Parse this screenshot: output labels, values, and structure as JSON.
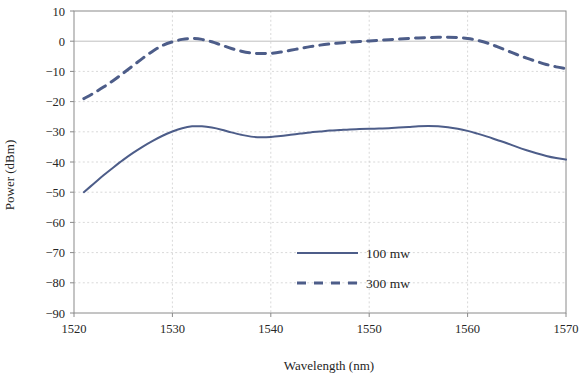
{
  "chart_data": {
    "type": "line",
    "title": "",
    "xlabel": "Wavelength (nm)",
    "ylabel": "Power (dBm)",
    "xlim": [
      1520,
      1570
    ],
    "ylim": [
      -90,
      10
    ],
    "xticks": [
      "1520",
      "1530",
      "1540",
      "1550",
      "1560",
      "1570"
    ],
    "xtick_values": [
      1520,
      1530,
      1540,
      1550,
      1560,
      1570
    ],
    "yticks": [
      "10",
      "0",
      "−10",
      "−20",
      "−30",
      "−40",
      "−50",
      "−60",
      "−70",
      "−80",
      "−90"
    ],
    "ytick_values": [
      10,
      0,
      -10,
      -20,
      -30,
      -40,
      -50,
      -60,
      -70,
      -80,
      -90
    ],
    "grid": true,
    "legend_position": "center-bottom-inside",
    "series": [
      {
        "name": "100 mw",
        "style": "solid",
        "color": "#4d5d89",
        "x": [
          1521.0,
          1522.0,
          1523.0,
          1524.0,
          1525.0,
          1526.0,
          1527.0,
          1528.0,
          1529.0,
          1530.0,
          1531.0,
          1532.0,
          1533.0,
          1534.0,
          1535.0,
          1536.0,
          1537.0,
          1538.0,
          1539.0,
          1540.0,
          1541.0,
          1542.0,
          1543.0,
          1544.0,
          1545.0,
          1546.0,
          1547.0,
          1548.0,
          1549.0,
          1550.0,
          1551.0,
          1552.0,
          1553.0,
          1554.0,
          1555.0,
          1556.0,
          1557.0,
          1558.0,
          1559.0,
          1560.0,
          1561.0,
          1562.0,
          1563.0,
          1564.0,
          1565.0,
          1566.0,
          1567.0,
          1568.0,
          1569.0,
          1570.0
        ],
        "y": [
          -50.0,
          -47.2,
          -44.4,
          -41.8,
          -39.3,
          -37.0,
          -34.9,
          -33.0,
          -31.3,
          -29.9,
          -28.8,
          -28.2,
          -28.2,
          -28.6,
          -29.3,
          -30.2,
          -31.0,
          -31.6,
          -31.8,
          -31.7,
          -31.4,
          -31.0,
          -30.6,
          -30.2,
          -29.9,
          -29.6,
          -29.4,
          -29.2,
          -29.1,
          -29.0,
          -28.9,
          -28.8,
          -28.6,
          -28.4,
          -28.2,
          -28.1,
          -28.2,
          -28.5,
          -29.0,
          -29.7,
          -30.6,
          -31.6,
          -32.7,
          -33.8,
          -35.0,
          -36.1,
          -37.1,
          -38.0,
          -38.7,
          -39.2
        ]
      },
      {
        "name": "300 mw",
        "style": "dashed",
        "color": "#4d5d89",
        "x": [
          1521.0,
          1522.0,
          1523.0,
          1524.0,
          1525.0,
          1526.0,
          1527.0,
          1528.0,
          1529.0,
          1530.0,
          1531.0,
          1532.0,
          1533.0,
          1534.0,
          1535.0,
          1536.0,
          1537.0,
          1538.0,
          1539.0,
          1540.0,
          1541.0,
          1542.0,
          1543.0,
          1544.0,
          1545.0,
          1546.0,
          1547.0,
          1548.0,
          1549.0,
          1550.0,
          1551.0,
          1552.0,
          1553.0,
          1554.0,
          1555.0,
          1556.0,
          1557.0,
          1558.0,
          1559.0,
          1560.0,
          1561.0,
          1562.0,
          1563.0,
          1564.0,
          1565.0,
          1566.0,
          1567.0,
          1568.0,
          1569.0,
          1570.0
        ],
        "y": [
          -19.0,
          -17.2,
          -15.2,
          -13.0,
          -10.6,
          -8.1,
          -5.6,
          -3.3,
          -1.4,
          -0.2,
          0.6,
          0.9,
          0.6,
          -0.2,
          -1.3,
          -2.4,
          -3.3,
          -3.9,
          -4.1,
          -4.0,
          -3.6,
          -3.0,
          -2.4,
          -1.8,
          -1.3,
          -0.9,
          -0.6,
          -0.3,
          -0.1,
          0.1,
          0.3,
          0.5,
          0.7,
          0.9,
          1.1,
          1.2,
          1.3,
          1.3,
          1.2,
          0.9,
          0.3,
          -0.6,
          -1.8,
          -3.1,
          -4.4,
          -5.6,
          -6.7,
          -7.7,
          -8.5,
          -9.1
        ]
      }
    ],
    "annotations": []
  },
  "legend": {
    "entries": [
      {
        "label": "100 mw",
        "style": "solid"
      },
      {
        "label": "300 mw",
        "style": "dashed"
      }
    ]
  }
}
